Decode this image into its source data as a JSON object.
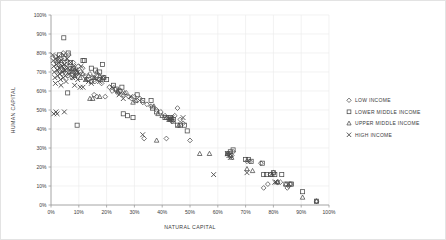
{
  "chart_data": {
    "type": "scatter",
    "title": "",
    "xlabel": "NATURAL CAPITAL",
    "ylabel": "HUMAN CAPITAL",
    "xlim": [
      0,
      100
    ],
    "ylim": [
      0,
      100
    ],
    "xticks": [
      "0%",
      "10%",
      "20%",
      "30%",
      "40%",
      "50%",
      "60%",
      "70%",
      "80%",
      "90%",
      "100%"
    ],
    "yticks": [
      "0%",
      "10%",
      "20%",
      "30%",
      "40%",
      "50%",
      "60%",
      "70%",
      "80%",
      "90%",
      "100%"
    ],
    "xtick_values": [
      0,
      10,
      20,
      30,
      40,
      50,
      60,
      70,
      80,
      90,
      100
    ],
    "ytick_values": [
      0,
      10,
      20,
      30,
      40,
      50,
      60,
      70,
      80,
      90,
      100
    ],
    "grid": true,
    "legend_position": "right",
    "unit": "percent",
    "series": [
      {
        "name": "LOW INCOME",
        "marker": "diamond",
        "color": "#4a4a4a",
        "points": [
          [
            1.5,
            78
          ],
          [
            2.0,
            75
          ],
          [
            2.4,
            72
          ],
          [
            2.8,
            70
          ],
          [
            3.2,
            77
          ],
          [
            3.6,
            74
          ],
          [
            4.0,
            69
          ],
          [
            4.4,
            80
          ],
          [
            4.8,
            73
          ],
          [
            5.2,
            71
          ],
          [
            5.6,
            76
          ],
          [
            6.0,
            68
          ],
          [
            6.4,
            79
          ],
          [
            6.8,
            72
          ],
          [
            7.2,
            70
          ],
          [
            7.6,
            67
          ],
          [
            8.0,
            75
          ],
          [
            8.6,
            71
          ],
          [
            9.2,
            69
          ],
          [
            9.8,
            73
          ],
          [
            10.6,
            70
          ],
          [
            11.4,
            72
          ],
          [
            12.2,
            68
          ],
          [
            13.0,
            66
          ],
          [
            14.0,
            69
          ],
          [
            15.0,
            67
          ],
          [
            15.8,
            65
          ],
          [
            16.6,
            68
          ],
          [
            17.4,
            66
          ],
          [
            18.2,
            64
          ],
          [
            19.0,
            67
          ],
          [
            15.5,
            58
          ],
          [
            16.5,
            57
          ],
          [
            19.5,
            57
          ],
          [
            21.0,
            62
          ],
          [
            22.0,
            60
          ],
          [
            23.0,
            61
          ],
          [
            24.0,
            59
          ],
          [
            25.0,
            60
          ],
          [
            26.0,
            58
          ],
          [
            27.0,
            59
          ],
          [
            28.0,
            57
          ],
          [
            29.0,
            56
          ],
          [
            30.0,
            57
          ],
          [
            31.0,
            55
          ],
          [
            32.0,
            56
          ],
          [
            33.0,
            54
          ],
          [
            34.5,
            53
          ],
          [
            36.0,
            52
          ],
          [
            38.0,
            50
          ],
          [
            39.5,
            49
          ],
          [
            41.0,
            47
          ],
          [
            42.0,
            46
          ],
          [
            42.8,
            45
          ],
          [
            43.5,
            44
          ],
          [
            44.5,
            47
          ],
          [
            45.5,
            51
          ],
          [
            46.5,
            45
          ],
          [
            47.5,
            43
          ],
          [
            33.5,
            35
          ],
          [
            41.5,
            35
          ],
          [
            50.0,
            34
          ],
          [
            64.0,
            27
          ],
          [
            65.0,
            26
          ],
          [
            65.5,
            28
          ],
          [
            70.5,
            23
          ],
          [
            71.5,
            23
          ],
          [
            75.5,
            22
          ],
          [
            76.5,
            9
          ],
          [
            78.0,
            11
          ],
          [
            79.0,
            16
          ],
          [
            80.0,
            17
          ],
          [
            81.5,
            12
          ],
          [
            82.5,
            12
          ],
          [
            85.0,
            9
          ],
          [
            85.5,
            10
          ],
          [
            86.0,
            11
          ],
          [
            95.5,
            2
          ]
        ]
      },
      {
        "name": "LOWER MIDDLE INCOME",
        "marker": "square",
        "color": "#4a4a4a",
        "points": [
          [
            4.6,
            88
          ],
          [
            3.0,
            79
          ],
          [
            5.0,
            77
          ],
          [
            6.2,
            80
          ],
          [
            7.0,
            75
          ],
          [
            8.0,
            72
          ],
          [
            9.0,
            70
          ],
          [
            6.0,
            59
          ],
          [
            9.4,
            42
          ],
          [
            11.5,
            76
          ],
          [
            12.0,
            76
          ],
          [
            14.5,
            72
          ],
          [
            16.0,
            71
          ],
          [
            17.5,
            70
          ],
          [
            18.5,
            74
          ],
          [
            19.0,
            67
          ],
          [
            20.0,
            66
          ],
          [
            22.5,
            63
          ],
          [
            23.5,
            61
          ],
          [
            24.5,
            60
          ],
          [
            25.5,
            62
          ],
          [
            26.0,
            48
          ],
          [
            27.5,
            47
          ],
          [
            29.5,
            46
          ],
          [
            31.0,
            58
          ],
          [
            33.0,
            55
          ],
          [
            36.0,
            55
          ],
          [
            36.5,
            51
          ],
          [
            38.0,
            49
          ],
          [
            41.0,
            46
          ],
          [
            43.0,
            46
          ],
          [
            44.0,
            45
          ],
          [
            45.5,
            42
          ],
          [
            46.5,
            42
          ],
          [
            48.0,
            42
          ],
          [
            49.0,
            39
          ],
          [
            63.5,
            27
          ],
          [
            64.5,
            28
          ],
          [
            65.5,
            29
          ],
          [
            70.0,
            24
          ],
          [
            71.0,
            24
          ],
          [
            72.0,
            23
          ],
          [
            76.0,
            22
          ],
          [
            76.5,
            16
          ],
          [
            77.5,
            16
          ],
          [
            79.0,
            16
          ],
          [
            80.0,
            17
          ],
          [
            80.5,
            16
          ],
          [
            83.0,
            16
          ],
          [
            84.5,
            11
          ],
          [
            86.0,
            11
          ],
          [
            86.5,
            11
          ],
          [
            90.5,
            7
          ],
          [
            95.5,
            2
          ]
        ]
      },
      {
        "name": "UPPER MIDDLE INCOME",
        "marker": "triangle",
        "color": "#4a4a4a",
        "points": [
          [
            2.5,
            76
          ],
          [
            3.5,
            73
          ],
          [
            4.5,
            71
          ],
          [
            5.5,
            74
          ],
          [
            6.5,
            70
          ],
          [
            7.5,
            72
          ],
          [
            8.5,
            68
          ],
          [
            9.5,
            70
          ],
          [
            10.5,
            67
          ],
          [
            11.5,
            69
          ],
          [
            12.5,
            66
          ],
          [
            13.5,
            68
          ],
          [
            14.5,
            65
          ],
          [
            15.5,
            67
          ],
          [
            16.5,
            70
          ],
          [
            17.5,
            68
          ],
          [
            18.0,
            66
          ],
          [
            14.0,
            56
          ],
          [
            15.0,
            56
          ],
          [
            17.5,
            57
          ],
          [
            24.0,
            60
          ],
          [
            26.5,
            59
          ],
          [
            29.5,
            54
          ],
          [
            30.5,
            55
          ],
          [
            37.0,
            52
          ],
          [
            38.5,
            48
          ],
          [
            40.0,
            47
          ],
          [
            41.5,
            46
          ],
          [
            42.5,
            45
          ],
          [
            43.5,
            46
          ],
          [
            38.0,
            34
          ],
          [
            44.0,
            44
          ],
          [
            46.0,
            42
          ],
          [
            53.5,
            27
          ],
          [
            57.0,
            27
          ],
          [
            63.5,
            27
          ],
          [
            64.5,
            26
          ],
          [
            65.0,
            25
          ],
          [
            70.5,
            19
          ],
          [
            72.5,
            18
          ],
          [
            79.5,
            16
          ],
          [
            81.5,
            12
          ],
          [
            84.5,
            11
          ],
          [
            90.5,
            4
          ],
          [
            95.5,
            2
          ]
        ]
      },
      {
        "name": "HIGH INCOME",
        "marker": "x",
        "color": "#4a4a4a",
        "points": [
          [
            0.6,
            79
          ],
          [
            0.8,
            76
          ],
          [
            1.0,
            73
          ],
          [
            1.2,
            70
          ],
          [
            1.4,
            67
          ],
          [
            1.6,
            64
          ],
          [
            1.8,
            77
          ],
          [
            2.0,
            74
          ],
          [
            2.2,
            71
          ],
          [
            2.4,
            68
          ],
          [
            2.6,
            78
          ],
          [
            2.8,
            75
          ],
          [
            3.0,
            72
          ],
          [
            3.2,
            69
          ],
          [
            3.4,
            66
          ],
          [
            3.6,
            63
          ],
          [
            3.8,
            76
          ],
          [
            4.0,
            73
          ],
          [
            4.2,
            70
          ],
          [
            4.4,
            67
          ],
          [
            4.6,
            79
          ],
          [
            4.8,
            74
          ],
          [
            5.0,
            71
          ],
          [
            5.2,
            68
          ],
          [
            5.4,
            65
          ],
          [
            5.8,
            77
          ],
          [
            6.2,
            72
          ],
          [
            6.6,
            69
          ],
          [
            7.0,
            75
          ],
          [
            7.4,
            70
          ],
          [
            7.8,
            67
          ],
          [
            8.2,
            73
          ],
          [
            8.6,
            68
          ],
          [
            9.0,
            71
          ],
          [
            9.6,
            66
          ],
          [
            10.2,
            69
          ],
          [
            10.8,
            73
          ],
          [
            8.5,
            63
          ],
          [
            10.5,
            62
          ],
          [
            11.5,
            62
          ],
          [
            12.5,
            66
          ],
          [
            13.5,
            65
          ],
          [
            14.5,
            64
          ],
          [
            15.5,
            67
          ],
          [
            16.5,
            66
          ],
          [
            17.5,
            65
          ],
          [
            18.5,
            67
          ],
          [
            1.0,
            48
          ],
          [
            1.8,
            49
          ],
          [
            2.2,
            48
          ],
          [
            4.8,
            49
          ],
          [
            22.0,
            62
          ],
          [
            24.5,
            58
          ],
          [
            26.0,
            56
          ],
          [
            28.5,
            57
          ],
          [
            33.0,
            37
          ],
          [
            42.5,
            45
          ],
          [
            43.0,
            45
          ],
          [
            43.5,
            46
          ],
          [
            47.5,
            46
          ],
          [
            58.5,
            16
          ],
          [
            63.5,
            27
          ],
          [
            64.0,
            26
          ],
          [
            64.5,
            25
          ],
          [
            70.5,
            17
          ],
          [
            80.5,
            12
          ],
          [
            81.0,
            12
          ]
        ]
      }
    ]
  },
  "legend": {
    "items": [
      {
        "label": "LOW INCOME",
        "marker": "diamond"
      },
      {
        "label": "LOWER MIDDLE INCOME",
        "marker": "square"
      },
      {
        "label": "UPPER MIDDLE INCOME",
        "marker": "triangle"
      },
      {
        "label": "HIGH INCOME",
        "marker": "x"
      }
    ]
  },
  "style": {
    "axis_color": "#9a9a9a",
    "grid_color": "#ededed",
    "marker_color": "#4a4a4a",
    "text_color": "#3a3a3a",
    "border_color": "#e3e3e3",
    "background": "#ffffff"
  }
}
